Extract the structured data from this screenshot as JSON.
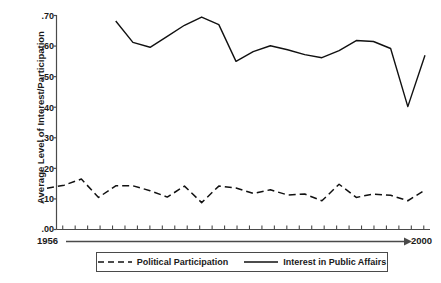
{
  "chart_data": {
    "type": "line",
    "title": "",
    "xlabel": "",
    "ylabel": "Average Level of Interest/Participation",
    "xlim": [
      1956,
      2000
    ],
    "ylim": [
      0.0,
      0.7
    ],
    "grid": false,
    "legend_position": "bottom",
    "x_axis": {
      "start_label": "1956",
      "end_label": "2000",
      "arrow": true,
      "tick_count": 30
    },
    "y_axis": {
      "ticks": [
        0.0,
        0.1,
        0.2,
        0.3,
        0.4,
        0.5,
        0.6,
        0.7
      ],
      "tick_labels": [
        ".00",
        ".10",
        ".20",
        ".30",
        ".40",
        ".50",
        ".60",
        ".70"
      ]
    },
    "series": [
      {
        "name": "Political Participation",
        "style": "dashed",
        "color": "#111111",
        "x": [
          1956,
          1958,
          1960,
          1962,
          1964,
          1966,
          1968,
          1970,
          1972,
          1974,
          1976,
          1978,
          1980,
          1982,
          1984,
          1986,
          1988,
          1990,
          1992,
          1994,
          1996,
          1998,
          2000
        ],
        "values": [
          0.135,
          0.145,
          0.165,
          0.105,
          0.143,
          0.143,
          0.127,
          0.106,
          0.142,
          0.088,
          0.142,
          0.136,
          0.118,
          0.13,
          0.113,
          0.116,
          0.094,
          0.148,
          0.105,
          0.116,
          0.112,
          0.094,
          0.129
        ]
      },
      {
        "name": "Interest in Public Affairs",
        "style": "solid",
        "color": "#111111",
        "x": [
          1964,
          1966,
          1968,
          1970,
          1972,
          1974,
          1976,
          1978,
          1980,
          1982,
          1984,
          1986,
          1988,
          1990,
          1992,
          1994,
          1996,
          1998,
          2000
        ],
        "values": [
          0.682,
          0.612,
          0.596,
          0.632,
          0.668,
          0.695,
          0.67,
          0.55,
          0.582,
          0.601,
          0.588,
          0.572,
          0.562,
          0.585,
          0.618,
          0.615,
          0.592,
          0.402,
          0.57
        ]
      }
    ]
  },
  "axis": {
    "y_title": "Average Level of Interest/Participation",
    "y_labels": [
      ".70",
      ".60",
      ".50",
      ".40",
      ".30",
      ".20",
      ".10",
      ".00"
    ],
    "x_start": "1956",
    "x_end": "2000"
  },
  "legend": {
    "items": [
      {
        "label": "Political Participation",
        "style": "dashed"
      },
      {
        "label": "Interest in Public Affairs",
        "style": "solid"
      }
    ]
  },
  "colors": {
    "line": "#111111",
    "axis": "#4a4a4a",
    "text": "#1a1a1a",
    "background": "#ffffff"
  }
}
